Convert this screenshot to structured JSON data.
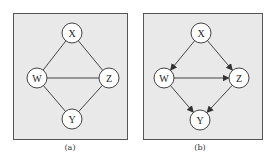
{
  "panels": [
    {
      "id": "a",
      "caption": "(a)",
      "box": {
        "x": 13,
        "y": 13,
        "w": 115,
        "h": 127
      },
      "nodes": [
        {
          "id": "X",
          "label": "X",
          "cx": 72,
          "cy": 33
        },
        {
          "id": "W",
          "label": "W",
          "cx": 37,
          "cy": 78
        },
        {
          "id": "Z",
          "label": "Z",
          "cx": 109,
          "cy": 78
        },
        {
          "id": "Y",
          "label": "Y",
          "cx": 72,
          "cy": 119
        }
      ],
      "edges": [
        {
          "from": "X",
          "to": "W",
          "directed": false
        },
        {
          "from": "X",
          "to": "Z",
          "directed": false
        },
        {
          "from": "W",
          "to": "Z",
          "directed": false
        },
        {
          "from": "W",
          "to": "Y",
          "directed": false
        },
        {
          "from": "Z",
          "to": "Y",
          "directed": false
        }
      ]
    },
    {
      "id": "b",
      "caption": "(b)",
      "box": {
        "x": 143,
        "y": 13,
        "w": 120,
        "h": 127
      },
      "nodes": [
        {
          "id": "X",
          "label": "X",
          "cx": 201,
          "cy": 33
        },
        {
          "id": "W",
          "label": "W",
          "cx": 164,
          "cy": 78
        },
        {
          "id": "Z",
          "label": "Z",
          "cx": 239,
          "cy": 78
        },
        {
          "id": "Y",
          "label": "Y",
          "cx": 200,
          "cy": 120
        }
      ],
      "edges": [
        {
          "from": "X",
          "to": "W",
          "directed": true
        },
        {
          "from": "X",
          "to": "Z",
          "directed": true
        },
        {
          "from": "W",
          "to": "Z",
          "directed": true
        },
        {
          "from": "W",
          "to": "Y",
          "directed": true
        },
        {
          "from": "Z",
          "to": "Y",
          "directed": true
        }
      ]
    }
  ],
  "style": {
    "panel_bg": "#e9e9e9",
    "node_fill": "#ffffff",
    "stroke": "#444444",
    "node_radius": 10
  }
}
